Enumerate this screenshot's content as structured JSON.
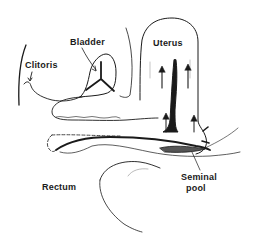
{
  "diagram": {
    "type": "anatomical-line-drawing",
    "labels": {
      "clitoris": "Clitoris",
      "bladder": "Bladder",
      "uterus": "Uterus",
      "rectum": "Rectum",
      "seminal_pool_line1": "Seminal",
      "seminal_pool_line2": "pool"
    },
    "colors": {
      "ink": "#1a1a1a",
      "background": "#ffffff",
      "seminal_pool_fill": "#555555"
    }
  }
}
